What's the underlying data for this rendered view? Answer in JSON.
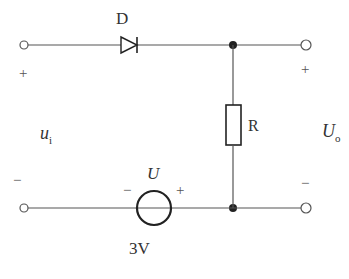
{
  "diagram": {
    "type": "circuit",
    "components": {
      "diode": {
        "label": "D"
      },
      "resistor": {
        "label": "R"
      },
      "source": {
        "label": "U",
        "value": "3V",
        "minus": "−",
        "plus": "+"
      }
    },
    "input": {
      "label_main": "u",
      "label_sub": "i",
      "plus": "+",
      "minus": "−"
    },
    "output": {
      "label_main": "U",
      "label_sub": "o",
      "plus": "+",
      "minus": "−"
    }
  },
  "colors": {
    "wire": "#555555",
    "component": "#222222",
    "background": "#ffffff"
  }
}
